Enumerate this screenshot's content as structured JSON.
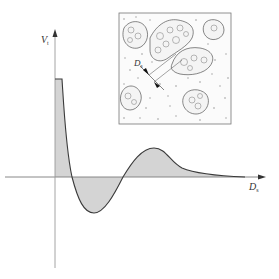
{
  "figure": {
    "type": "potential-vs-separation-diagram",
    "colors": {
      "background": "#ffffff",
      "axis": "#7a7a7a",
      "curve": "#3a3a3a",
      "fill": "#d4d4d4",
      "inset_border": "#777777",
      "aggregate_stroke": "#555555",
      "gap_marker": "#111111"
    }
  },
  "axes": {
    "y_label_main": "V",
    "y_label_sub": "t",
    "x_label_main": "D",
    "x_label_sub": "s"
  },
  "inset": {
    "description": "particle aggregates (flocs) in a dispersed medium with separation distance",
    "gap_label_main": "D",
    "gap_label_sub": "s",
    "aggregate_count": 6
  },
  "curve": {
    "features": [
      {
        "name": "plateau-top",
        "note": "flat maximum at small separation"
      },
      {
        "name": "first-zero-crossing"
      },
      {
        "name": "primary-minimum",
        "note": "negative well"
      },
      {
        "name": "second-zero-crossing"
      },
      {
        "name": "secondary-maximum",
        "note": "positive hump"
      },
      {
        "name": "decaying-tail",
        "note": "approaches zero at large D_s"
      }
    ]
  }
}
